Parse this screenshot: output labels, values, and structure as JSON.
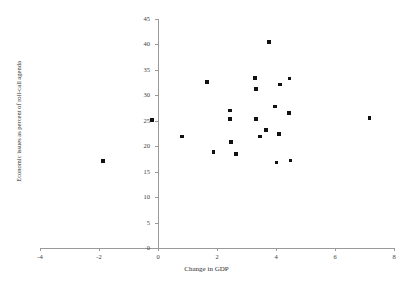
{
  "chart_data": {
    "type": "scatter",
    "title": "",
    "xlabel": "Change in GDP",
    "ylabel": "Economic issues as percent of roll-call agenda",
    "xlim": [
      -4,
      8
    ],
    "ylim": [
      0,
      45
    ],
    "xticks": [
      -4,
      -2,
      0,
      2,
      4,
      6,
      8
    ],
    "xtick_labels": [
      "-4",
      "-2",
      "0",
      "2",
      "4",
      "6",
      "8"
    ],
    "yticks": [
      0,
      5,
      10,
      15,
      20,
      25,
      30,
      35,
      40,
      45
    ],
    "ytick_labels": [
      "0",
      "5",
      "10",
      "15",
      "20",
      "25",
      "30",
      "35",
      "40",
      "45"
    ],
    "grid": false,
    "legend": false,
    "marker": "square",
    "marker_color": "#111111",
    "axis_color": "#9a9a9a",
    "points": [
      {
        "x": -1.86,
        "y": 17.1
      },
      {
        "x": -0.2,
        "y": 25.1
      },
      {
        "x": 0.81,
        "y": 21.9
      },
      {
        "x": 1.66,
        "y": 32.6
      },
      {
        "x": 1.88,
        "y": 18.9
      },
      {
        "x": 2.44,
        "y": 27.0
      },
      {
        "x": 2.44,
        "y": 25.3
      },
      {
        "x": 2.47,
        "y": 20.8
      },
      {
        "x": 2.64,
        "y": 18.5
      },
      {
        "x": 3.29,
        "y": 33.4
      },
      {
        "x": 3.32,
        "y": 31.2
      },
      {
        "x": 3.32,
        "y": 25.4
      },
      {
        "x": 3.46,
        "y": 21.9
      },
      {
        "x": 3.66,
        "y": 23.2
      },
      {
        "x": 3.76,
        "y": 40.5
      },
      {
        "x": 3.97,
        "y": 27.8
      },
      {
        "x": 4.02,
        "y": 16.8
      },
      {
        "x": 4.1,
        "y": 22.4
      },
      {
        "x": 4.14,
        "y": 32.1
      },
      {
        "x": 4.44,
        "y": 26.5
      },
      {
        "x": 4.46,
        "y": 33.3
      },
      {
        "x": 4.49,
        "y": 17.2
      },
      {
        "x": 7.17,
        "y": 25.5
      }
    ]
  }
}
